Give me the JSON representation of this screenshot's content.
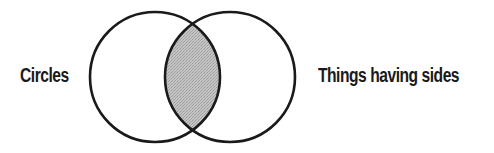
{
  "diagram": {
    "type": "venn",
    "sets": [
      {
        "id": "circles",
        "label": "Circles"
      },
      {
        "id": "sides",
        "label": "Things having sides"
      }
    ],
    "intersection": {
      "shaded": true
    },
    "colors": {
      "stroke": "#1a1a1a",
      "intersection_fill": "#b9b9b9",
      "background": "#ffffff"
    }
  }
}
